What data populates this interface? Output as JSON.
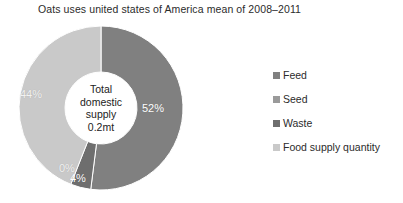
{
  "chart_data": {
    "type": "pie",
    "variant": "donut",
    "title": "Oats uses united states of America mean of 2008–2011",
    "xlabel": "",
    "ylabel": "",
    "grid": false,
    "legend_position": "right",
    "start_angle_deg": 0,
    "direction": "clockwise",
    "center_label": {
      "lines": [
        "Total",
        "domestic",
        "supply",
        "0.2mt"
      ],
      "total_value": 0.2,
      "total_units": "mt"
    },
    "categories": [
      "Feed",
      "Seed",
      "Waste",
      "Food supply quantity"
    ],
    "values": [
      52,
      0,
      4,
      44
    ],
    "value_labels": [
      "52%",
      "0%",
      "4%",
      "44%"
    ],
    "colors": [
      "#808080",
      "#9a9a9a",
      "#6e6e6e",
      "#c9c9c9"
    ],
    "slices": [
      {
        "name": "Feed",
        "value": 52,
        "label": "52%",
        "color": "#808080"
      },
      {
        "name": "Seed",
        "value": 0,
        "label": "0%",
        "color": "#9a9a9a"
      },
      {
        "name": "Waste",
        "value": 4,
        "label": "4%",
        "color": "#6e6e6e"
      },
      {
        "name": "Food supply quantity",
        "value": 44,
        "label": "44%",
        "color": "#c9c9c9"
      }
    ],
    "callouts": [
      {
        "name": "feed",
        "text": "52%",
        "x": 142,
        "y": 102,
        "tone": "bright"
      },
      {
        "name": "food-supply-quantity",
        "text": "44%",
        "x": 20,
        "y": 88,
        "tone": "dim"
      },
      {
        "name": "seed",
        "text": "0%",
        "x": 59,
        "y": 162,
        "tone": "dim"
      },
      {
        "name": "waste",
        "text": "4%",
        "x": 70,
        "y": 172,
        "tone": "bright"
      }
    ]
  },
  "legend": {
    "items": [
      {
        "label": "Feed",
        "color": "#808080"
      },
      {
        "label": "Seed",
        "color": "#9a9a9a"
      },
      {
        "label": "Waste",
        "color": "#6e6e6e"
      },
      {
        "label": "Food supply quantity",
        "color": "#c9c9c9"
      }
    ]
  }
}
